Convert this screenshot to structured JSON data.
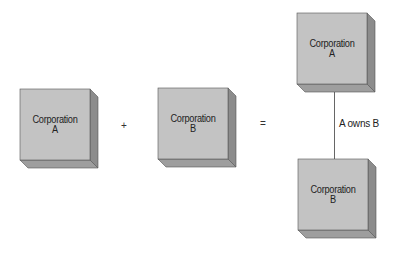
{
  "colors": {
    "front": "#c3c3c3",
    "side": "#8c8c8c",
    "bottom": "#9e9e9e",
    "edge": "#555555"
  },
  "equation": {
    "left_box": {
      "line1": "Corporation",
      "line2": "A"
    },
    "plus": "+",
    "middle_box": {
      "line1": "Corporation",
      "line2": "B"
    },
    "equals": "="
  },
  "result": {
    "top_box": {
      "line1": "Corporation",
      "line2": "A"
    },
    "bottom_box": {
      "line1": "Corporation",
      "line2": "B"
    },
    "relationship_label": "A owns B"
  }
}
